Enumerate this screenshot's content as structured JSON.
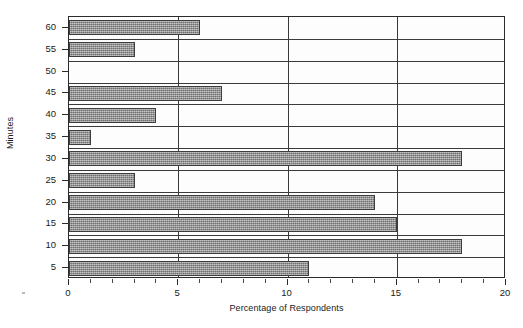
{
  "chart_data": {
    "type": "bar",
    "orientation": "horizontal",
    "title": "",
    "xlabel": "Percentage of Respondents",
    "ylabel": "Minutes",
    "categories": [
      "5",
      "10",
      "15",
      "20",
      "25",
      "30",
      "35",
      "40",
      "45",
      "50",
      "55",
      "60"
    ],
    "values": [
      11,
      18,
      15,
      14,
      3,
      18,
      1,
      4,
      7,
      0,
      3,
      6
    ],
    "xlim": [
      0,
      20
    ],
    "xticks": [
      0,
      5,
      10,
      15,
      20
    ],
    "xtick_labels": [
      "0",
      "5",
      "10",
      "15",
      "20"
    ],
    "ytick_labels": [
      "5",
      "10",
      "15",
      "20",
      "25",
      "30",
      "35",
      "40",
      "45",
      "50",
      "55",
      "60"
    ],
    "grid": "horizontal-and-vertical",
    "legend": "none",
    "series": [
      {
        "name": "Percentage of Respondents",
        "values": [
          11,
          18,
          15,
          14,
          3,
          18,
          1,
          4,
          7,
          0,
          3,
          6
        ]
      }
    ],
    "bar_fill_color": "#8e8e8e",
    "bar_edge_color": "#3d3d3d",
    "axis_color": "#2b2b2b",
    "plot_background": "#fdfdfd"
  },
  "axis_titles": {
    "x": "Percentage of Respondents",
    "y": "Minutes"
  },
  "title_strip": {
    "text": ""
  }
}
